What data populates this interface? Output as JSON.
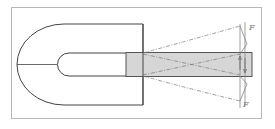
{
  "diagram": {
    "type": "magnet-pole-piece-schematic",
    "frame": {
      "x": 11,
      "y": 7,
      "w": 251,
      "h": 112,
      "stroke": "#b8b8b8"
    },
    "colors": {
      "line": "#444444",
      "dashed": "#777777",
      "bar_fill": "#d6d6d6",
      "bar_stroke": "#555555",
      "force_line": "#888888",
      "label": "#777777"
    },
    "labels": {
      "force_top": "F",
      "force_bottom": "F"
    }
  }
}
